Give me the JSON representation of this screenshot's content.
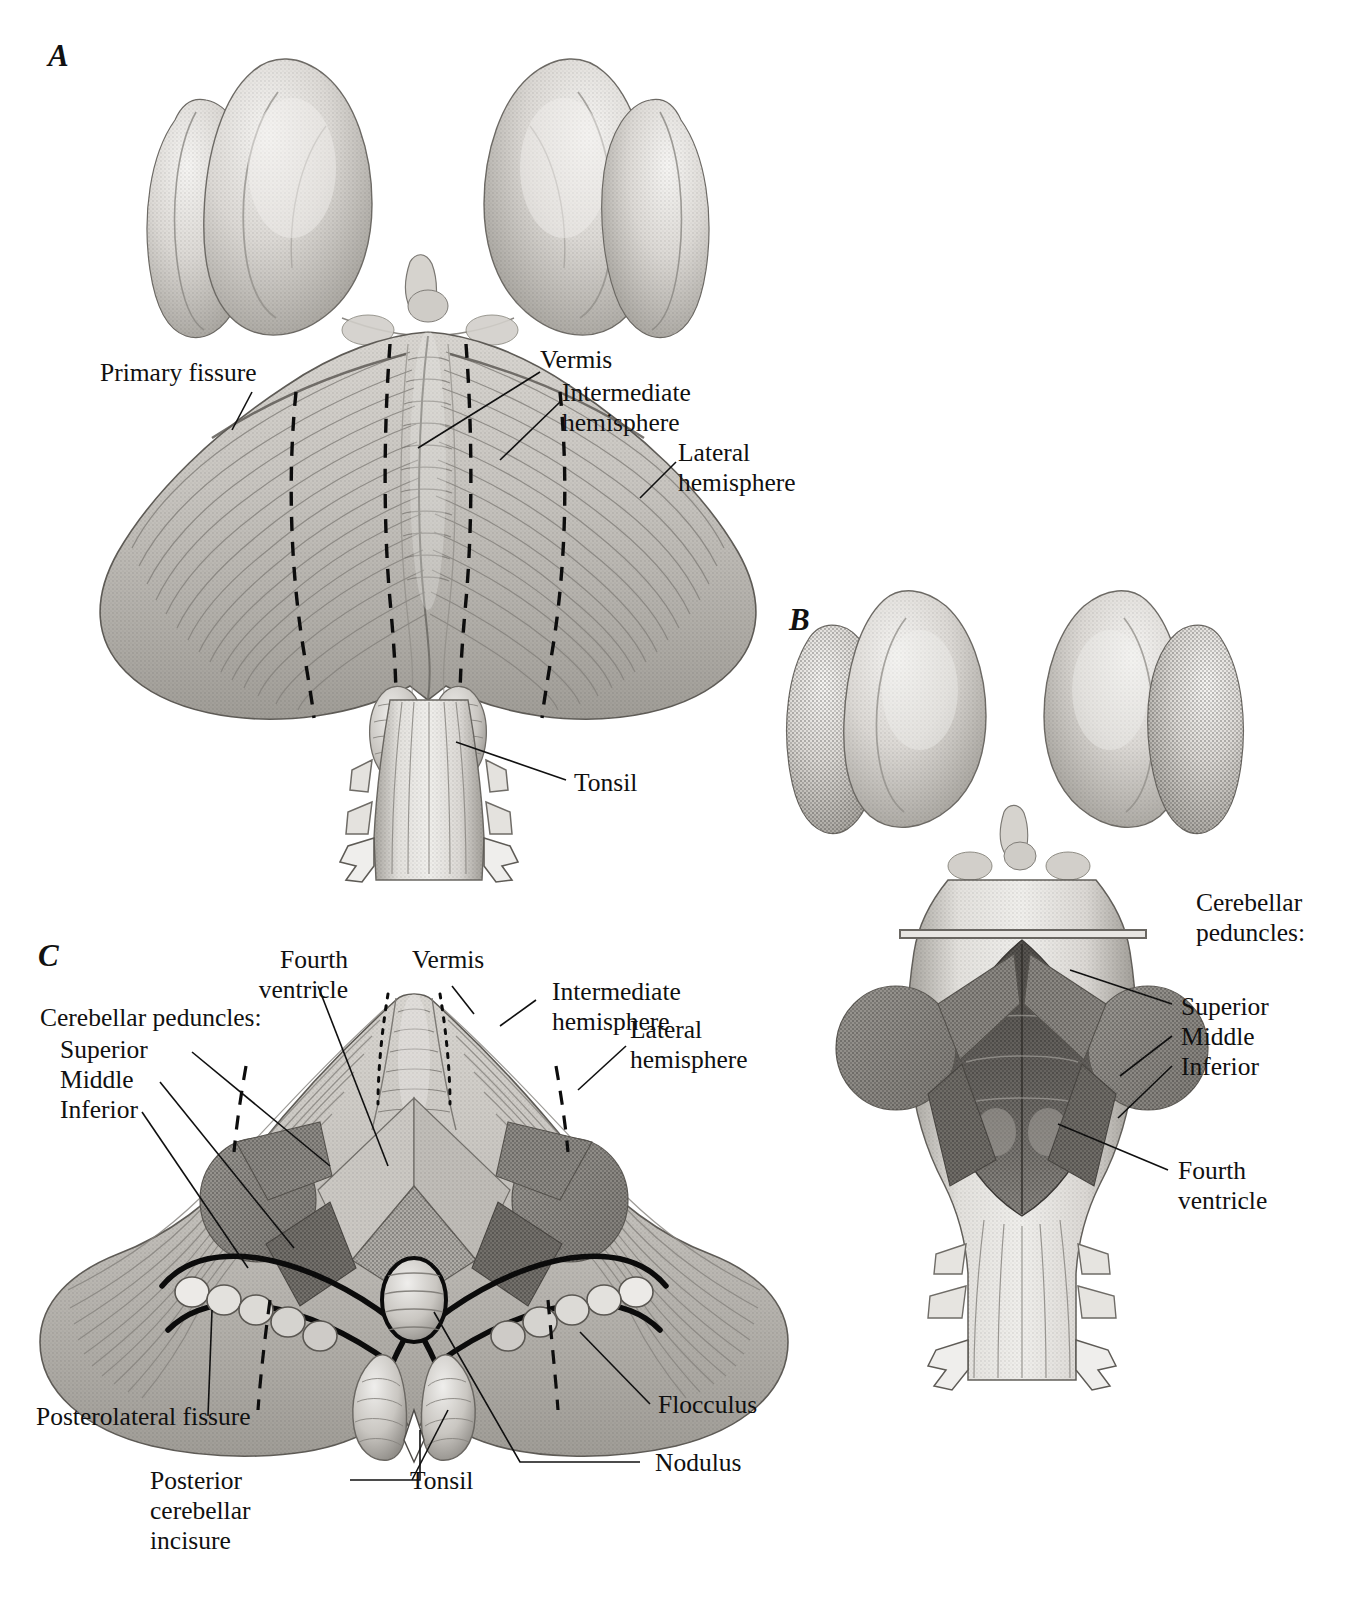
{
  "figure": {
    "kind": "anatomical-illustration",
    "style": "grayscale stipple / halftone medical illustration",
    "background_color": "#ffffff",
    "ink_color": "#101010"
  },
  "panels": [
    {
      "id": "A",
      "letter": "A",
      "view": "dorsal view of cerebellum with brainstem",
      "labels": [
        {
          "key": "primary_fissure",
          "text": "Primary fissure"
        },
        {
          "key": "vermis",
          "text": "Vermis"
        },
        {
          "key": "intermediate_hemisphere",
          "text": "Intermediate\nhemisphere"
        },
        {
          "key": "lateral_hemisphere",
          "text": "Lateral\nhemisphere"
        },
        {
          "key": "tonsil",
          "text": "Tonsil"
        }
      ]
    },
    {
      "id": "B",
      "letter": "B",
      "view": "dorsal view of brainstem with cerebellum removed",
      "labels": [
        {
          "key": "peduncles_heading",
          "text": "Cerebellar\npeduncles:"
        },
        {
          "key": "superior",
          "text": "Superior"
        },
        {
          "key": "middle",
          "text": "Middle"
        },
        {
          "key": "inferior",
          "text": "Inferior"
        },
        {
          "key": "fourth_ventricle",
          "text": "Fourth\nventricle"
        }
      ]
    },
    {
      "id": "C",
      "letter": "C",
      "view": "anterior view of cerebellum with peduncles cut",
      "labels": [
        {
          "key": "fourth_ventricle",
          "text": "Fourth\nventricle"
        },
        {
          "key": "vermis",
          "text": "Vermis"
        },
        {
          "key": "intermediate_hemisphere",
          "text": "Intermediate\nhemisphere"
        },
        {
          "key": "lateral_hemisphere",
          "text": "Lateral\nhemisphere"
        },
        {
          "key": "peduncles_heading",
          "text": "Cerebellar peduncles:"
        },
        {
          "key": "superior",
          "text": "Superior"
        },
        {
          "key": "middle",
          "text": "Middle"
        },
        {
          "key": "inferior",
          "text": "Inferior"
        },
        {
          "key": "posterolateral_fissure",
          "text": "Posterolateral fissure"
        },
        {
          "key": "posterior_cerebellar_incisure",
          "text": "Posterior\ncerebellar\nincisure"
        },
        {
          "key": "tonsil",
          "text": "Tonsil"
        },
        {
          "key": "nodulus",
          "text": "Nodulus"
        },
        {
          "key": "flocculus",
          "text": "Flocculus"
        }
      ]
    }
  ],
  "colors": {
    "ink": "#101010",
    "tissue_light": "#e6e4e0",
    "tissue_mid": "#c3c0bb",
    "tissue_shadow": "#9b9892",
    "tissue_deep": "#7a7772",
    "cut_surface": "#8f8c87",
    "cut_surface_dark": "#6e6b66",
    "ventricle_floor": "#5d5a56",
    "highlight": "#f4f3f1"
  }
}
